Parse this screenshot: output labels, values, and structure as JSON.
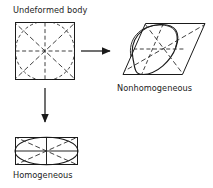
{
  "figure": {
    "title_label": "Undeformed body",
    "nonhomogeneous_label": "Nonhomogeneous",
    "homogeneous_label": "Homogeneous",
    "colors": {
      "stroke": "#1a1a1a",
      "background": "#ffffff",
      "dashed": "#2b2b2b"
    },
    "arrows": [
      {
        "name": "arrow-to-nonhomogeneous",
        "direction": "right"
      },
      {
        "name": "arrow-to-homogeneous",
        "direction": "down"
      }
    ],
    "shapes": [
      {
        "name": "undeformed-square",
        "outline": "square",
        "inscribed": "circle",
        "construction_lines": [
          "horizontal",
          "vertical",
          "diagonal-up",
          "diagonal-down"
        ],
        "line_style": "dashed"
      },
      {
        "name": "nonhomogeneous-parallelogram",
        "outline": "parallelogram",
        "inscribed": "lens",
        "construction_lines": [
          "horizontal",
          "vertical",
          "diagonal-up",
          "diagonal-down"
        ],
        "line_style": "dashed"
      },
      {
        "name": "homogeneous-rectangle",
        "outline": "rectangle",
        "inscribed": "ellipse",
        "construction_lines": [
          "horizontal",
          "vertical",
          "diagonal-up",
          "diagonal-down"
        ],
        "line_style": "mixed"
      }
    ]
  }
}
